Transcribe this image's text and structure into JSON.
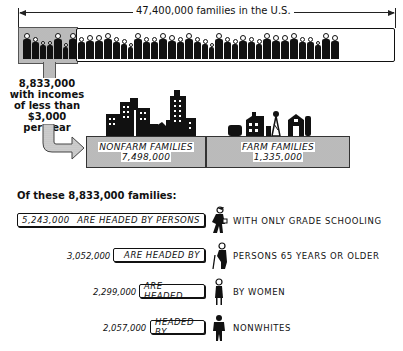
{
  "header": {
    "total_label": "47,400,000 families in the U.S."
  },
  "low_income": {
    "caption_lines": [
      "8,833,000",
      "with incomes",
      "of less than",
      "$3,000",
      "per year"
    ]
  },
  "split": {
    "nonfarm": {
      "label": "NONFARM FAMILIES",
      "value": "7,498,000"
    },
    "farm": {
      "label": "FARM FAMILIES",
      "value": "1,335,000"
    }
  },
  "breakdown": {
    "title": "Of these 8,833,000 families:",
    "rows": [
      {
        "value": "5,243,000",
        "box_text": "ARE HEADED BY PERSONS",
        "tail": "WITH ONLY GRADE SCHOOLING",
        "icon": "schoolboy-icon"
      },
      {
        "value": "3,052,000",
        "box_text": "ARE HEADED BY",
        "tail": "PERSONS 65 YEARS OR OLDER",
        "icon": "elderly-person-with-cane-icon"
      },
      {
        "value": "2,299,000",
        "box_text": "ARE HEADED",
        "tail": "BY WOMEN",
        "icon": "woman-icon"
      },
      {
        "value": "2,057,000",
        "box_text": "HEADED BY",
        "tail": "NONWHITES",
        "icon": "man-icon"
      }
    ]
  },
  "colors": {
    "ink": "#111111",
    "shade": "#d6d6d6",
    "paper": "#ffffff"
  }
}
